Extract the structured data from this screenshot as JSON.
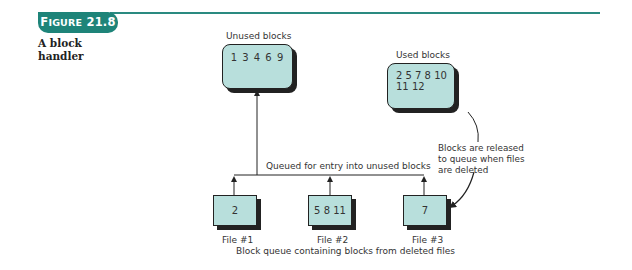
{
  "figure": {
    "badge_prefix": "F",
    "badge_smallcaps": "IGURE",
    "badge_number": "21.8",
    "caption_line1": "A block",
    "caption_line2": "handler"
  },
  "colors": {
    "accent": "#1e8479",
    "box_fill": "#b8dfdc",
    "line": "#222222"
  },
  "diagram": {
    "unused": {
      "title": "Unused blocks",
      "contents": "1 3 4 6 9"
    },
    "used": {
      "title": "Used blocks",
      "line1": "2 5 7 8 10",
      "line2": "11 12"
    },
    "release_note": {
      "line1": "Blocks are released",
      "line2": "to queue when files",
      "line3": "are deleted"
    },
    "queue_label": "Queued for entry into unused blocks",
    "files": [
      {
        "label": "File #1",
        "contents": "2"
      },
      {
        "label": "File #2",
        "contents": "5 8 11"
      },
      {
        "label": "File #3",
        "contents": "7"
      }
    ],
    "queue_caption": "Block queue containing blocks from deleted files"
  }
}
